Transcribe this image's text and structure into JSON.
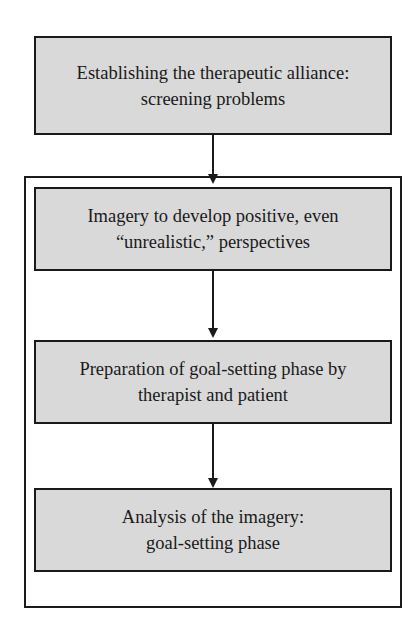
{
  "diagram": {
    "type": "flowchart",
    "nodes": [
      {
        "id": "step1",
        "lines": [
          "Establishing the therapeutic alliance:",
          "screening problems"
        ]
      },
      {
        "id": "step2",
        "lines": [
          "Imagery to develop positive, even",
          "“unrealistic,” perspectives"
        ]
      },
      {
        "id": "step3",
        "lines": [
          "Preparation of goal-setting phase by",
          "therapist and patient"
        ]
      },
      {
        "id": "step4",
        "lines": [
          "Analysis of the imagery:",
          "goal-setting phase"
        ]
      }
    ],
    "edges": [
      {
        "from": "step1",
        "to": "step2"
      },
      {
        "from": "step2",
        "to": "step3"
      },
      {
        "from": "step3",
        "to": "step4"
      }
    ],
    "groups": [
      {
        "id": "imagery-phase-group",
        "contains": [
          "step2",
          "step3",
          "step4"
        ]
      }
    ],
    "colors": {
      "box_fill": "#d9d9d9",
      "stroke": "#1a1a1a",
      "background": "#ffffff"
    }
  }
}
